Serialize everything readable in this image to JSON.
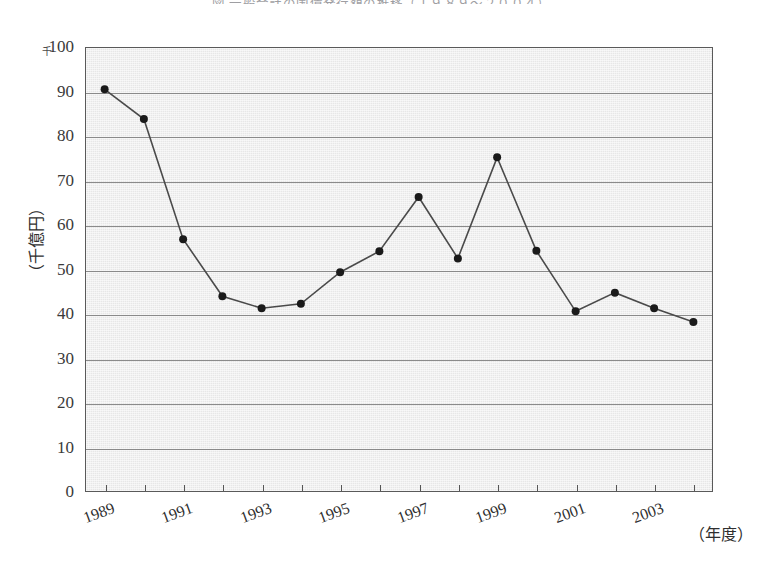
{
  "figure": {
    "title": "図   一般会計の国債発行額の推移（１９８９～２００４）",
    "y_unit_marker": "千",
    "y_axis_title": "（千億円）",
    "x_axis_title": "（年度）"
  },
  "chart_data": {
    "type": "line",
    "title": "図   一般会計の国債発行額の推移（１９８９～２００４）",
    "xlabel": "（年度）",
    "ylabel": "（千億円）",
    "ylim": [
      0,
      100
    ],
    "xlim": [
      1989,
      2004
    ],
    "ytick_step": 10,
    "yticks": [
      "0",
      "10",
      "20",
      "30",
      "40",
      "50",
      "60",
      "70",
      "80",
      "90",
      "100"
    ],
    "xticks_shown": [
      "1989",
      "1991",
      "1993",
      "1995",
      "1997",
      "1999",
      "2001",
      "2003"
    ],
    "grid": "horizontal",
    "legend": "none",
    "marker": "filled-circle",
    "line_color": "#4a4a4a",
    "marker_color": "#1a1a1a",
    "plot_background": "#e7e7e7",
    "x": [
      1989,
      1990,
      1991,
      1992,
      1993,
      1994,
      1995,
      1996,
      1997,
      1998,
      1999,
      2000,
      2001,
      2002,
      2003,
      2004
    ],
    "values": [
      90.5,
      83.8,
      56.8,
      44.0,
      41.3,
      42.3,
      49.4,
      54.1,
      66.3,
      52.5,
      75.2,
      54.2,
      40.6,
      44.8,
      41.3,
      38.2
    ],
    "series": [
      {
        "name": "国債発行額",
        "values": [
          90.5,
          83.8,
          56.8,
          44.0,
          41.3,
          42.3,
          49.4,
          54.1,
          66.3,
          52.5,
          75.2,
          54.2,
          40.6,
          44.8,
          41.3,
          38.2
        ]
      }
    ]
  }
}
